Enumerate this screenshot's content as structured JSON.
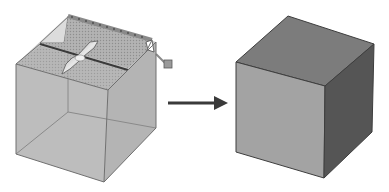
{
  "diagram": {
    "description": "Extrude/shell operation: translucent cube with drag manipulator becomes solid cube",
    "left_cube": {
      "label": "cube-before",
      "state": "transparent-wireframe",
      "fill": "#b9b9b9",
      "edge_color": "#707070",
      "vertices": {
        "top_back": [
          68,
          16
        ],
        "top_left": [
          16,
          64
        ],
        "top_right": [
          156,
          42
        ],
        "top_front": [
          108,
          90
        ],
        "bottom_left": [
          16,
          154
        ],
        "bottom_front": [
          104,
          182
        ],
        "bottom_right": [
          156,
          128
        ],
        "bottom_back": [
          68,
          112
        ]
      },
      "manipulator": {
        "plane_color": "#a8a8a8",
        "plane_light": "#dcdcdc",
        "handle_rail_color": "#8a8a8a",
        "drag_arrow_color": "#7d7d7d",
        "knob_color": "#9a9a9a"
      }
    },
    "arrow": {
      "label": "transform-arrow",
      "color": "#3a3a3a",
      "from": [
        168,
        103
      ],
      "to": [
        228,
        103
      ]
    },
    "right_cube": {
      "label": "cube-after",
      "state": "solid",
      "colors": {
        "top": "#7c7c7c",
        "front": "#a3a3a3",
        "right": "#555555",
        "edge": "#3e3e3e"
      },
      "vertices": {
        "top_back": [
          288,
          16
        ],
        "top_left": [
          236,
          62
        ],
        "top_right": [
          374,
          44
        ],
        "top_front": [
          325,
          86
        ],
        "bottom_left": [
          236,
          152
        ],
        "bottom_front": [
          324,
          178
        ],
        "bottom_right": [
          372,
          132
        ]
      }
    }
  }
}
